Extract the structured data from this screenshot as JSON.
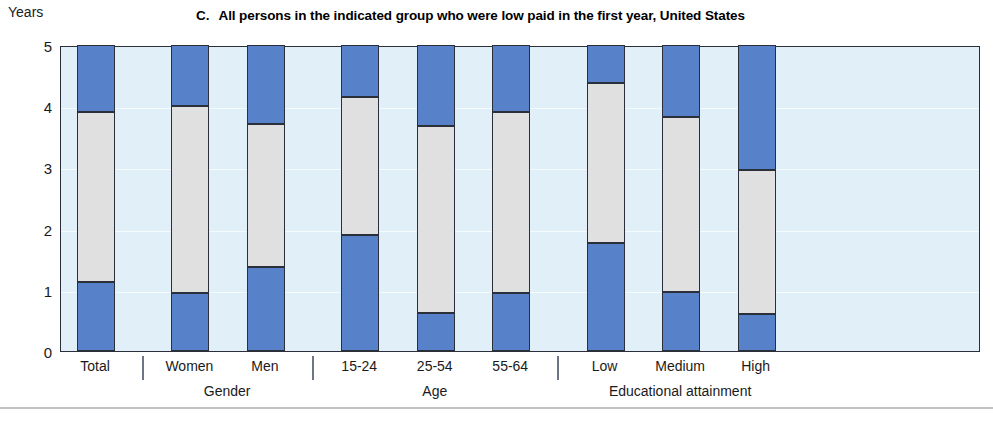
{
  "figure": {
    "panel_letter": "C.",
    "title": "All persons in the indicated group who were low paid in the first year, United States"
  },
  "colors": {
    "bar_blue": "#5781c9",
    "bar_gray": "#e0e0e0",
    "plot_background": "#e1f0f8",
    "frame": "#2a2f3a",
    "gridline": "#f4fbfe"
  },
  "chart_data": {
    "type": "bar",
    "title": "C.    All persons in the indicated group who were low paid in the first year, United States",
    "xlabel": "",
    "ylabel": "Years",
    "ylim": [
      0,
      5
    ],
    "yticks": [
      0,
      1,
      2,
      3,
      4,
      5
    ],
    "ytick_labels": [
      "0",
      "1",
      "2",
      "3",
      "4",
      "5"
    ],
    "grid": true,
    "legend": "none",
    "stacked": true,
    "categories": [
      "Total",
      "Women",
      "Men",
      "15-24",
      "25-54",
      "55-64",
      "Low",
      "Medium",
      "High"
    ],
    "groups": [
      {
        "name": "",
        "categories": [
          "Total"
        ]
      },
      {
        "name": "Gender",
        "categories": [
          "Women",
          "Men"
        ]
      },
      {
        "name": "Age",
        "categories": [
          "15-24",
          "25-54",
          "55-64"
        ]
      },
      {
        "name": "Educational attainment",
        "categories": [
          "Low",
          "Medium",
          "High"
        ]
      }
    ],
    "series": [
      {
        "name": "lower-segment",
        "color": "#5781c9",
        "values": [
          1.13,
          0.95,
          1.38,
          1.9,
          0.62,
          0.95,
          1.77,
          0.97,
          0.6
        ]
      },
      {
        "name": "middle-segment",
        "color": "#e0e0e0",
        "values": [
          2.77,
          3.05,
          2.33,
          2.25,
          3.05,
          2.95,
          2.61,
          2.86,
          2.35
        ]
      },
      {
        "name": "upper-segment",
        "color": "#5781c9",
        "values": [
          1.1,
          1.0,
          1.29,
          0.85,
          1.33,
          1.1,
          0.62,
          1.17,
          2.05
        ]
      }
    ],
    "cumulative_boundaries": [
      {
        "category": "Total",
        "lower_top": 1.13,
        "middle_top": 3.9
      },
      {
        "category": "Women",
        "lower_top": 0.95,
        "middle_top": 4.0
      },
      {
        "category": "Men",
        "lower_top": 1.38,
        "middle_top": 3.71
      },
      {
        "category": "15-24",
        "lower_top": 1.9,
        "middle_top": 4.15
      },
      {
        "category": "25-54",
        "lower_top": 0.62,
        "middle_top": 3.67
      },
      {
        "category": "55-64",
        "lower_top": 0.95,
        "middle_top": 3.9
      },
      {
        "category": "Low",
        "lower_top": 1.77,
        "middle_top": 4.38
      },
      {
        "category": "Medium",
        "lower_top": 0.97,
        "middle_top": 3.83
      },
      {
        "category": "High",
        "lower_top": 0.6,
        "middle_top": 2.95
      }
    ]
  }
}
